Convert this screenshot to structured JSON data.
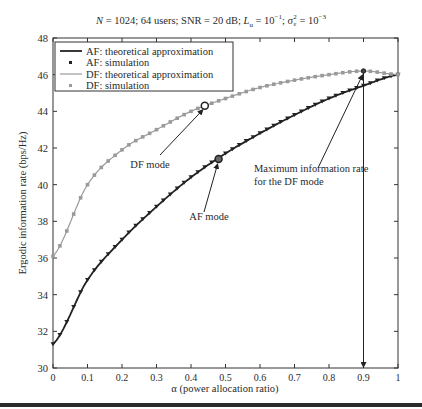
{
  "chart_data": {
    "type": "line",
    "title_parts": {
      "n": "N",
      "rest1": " = 1024; 64 users; SNR = 20 dB; ",
      "lu": "L",
      "lu_sub": "u",
      "rest2": " = 10",
      "exp1": "−1",
      "rest3": "; σ",
      "sig_sup": "2",
      "sig_sub": "ε",
      "rest4": " = 10",
      "exp2": "−3"
    },
    "xlabel": "α (power allocation ratio)",
    "ylabel": "Ergodic information rate (bps/Hz)",
    "xlim": [
      0,
      1
    ],
    "ylim": [
      30,
      48
    ],
    "xticks": [
      "0",
      "0.1",
      "0.2",
      "0.3",
      "0.4",
      "0.5",
      "0.6",
      "0.7",
      "0.8",
      "0.9",
      "1"
    ],
    "yticks": [
      "30",
      "32",
      "34",
      "36",
      "38",
      "40",
      "42",
      "44",
      "46",
      "48"
    ],
    "grid": false,
    "legend_position": "upper left",
    "legend": [
      {
        "label": "AF: theoretical approximation",
        "style": "line",
        "color": "#222222"
      },
      {
        "label": "AF: simulation",
        "style": "marker",
        "color": "#222222"
      },
      {
        "label": "DF: theoretical approximation",
        "style": "line",
        "color": "#9a9a9a"
      },
      {
        "label": "DF: simulation",
        "style": "marker",
        "color": "#9a9a9a"
      }
    ],
    "x": [
      0,
      0.1,
      0.2,
      0.3,
      0.4,
      0.5,
      0.6,
      0.7,
      0.8,
      0.9,
      1.0
    ],
    "series": [
      {
        "name": "AF: theoretical approximation",
        "values": [
          31.3,
          34.8,
          37.0,
          38.8,
          40.4,
          41.7,
          42.8,
          43.8,
          44.7,
          45.4,
          46.0
        ]
      },
      {
        "name": "AF: simulation",
        "values": [
          31.3,
          34.8,
          37.0,
          38.8,
          40.4,
          41.7,
          42.8,
          43.8,
          44.7,
          45.4,
          46.0
        ]
      },
      {
        "name": "DF: theoretical approximation",
        "values": [
          36.1,
          40.0,
          41.9,
          43.0,
          44.0,
          44.7,
          45.3,
          45.7,
          46.0,
          46.2,
          46.0
        ]
      },
      {
        "name": "DF: simulation",
        "values": [
          36.1,
          40.0,
          41.9,
          43.0,
          44.0,
          44.7,
          45.3,
          45.7,
          46.0,
          46.2,
          46.0
        ]
      }
    ],
    "annotations": [
      {
        "text": "DF mode",
        "point": [
          0.44,
          44.3
        ]
      },
      {
        "text": "AF mode",
        "point": [
          0.48,
          41.4
        ]
      },
      {
        "text": "Maximum information rate",
        "text2": "for the DF mode",
        "point": [
          0.9,
          46.2
        ],
        "vertical_arrow_to": [
          0.9,
          30
        ]
      }
    ]
  }
}
